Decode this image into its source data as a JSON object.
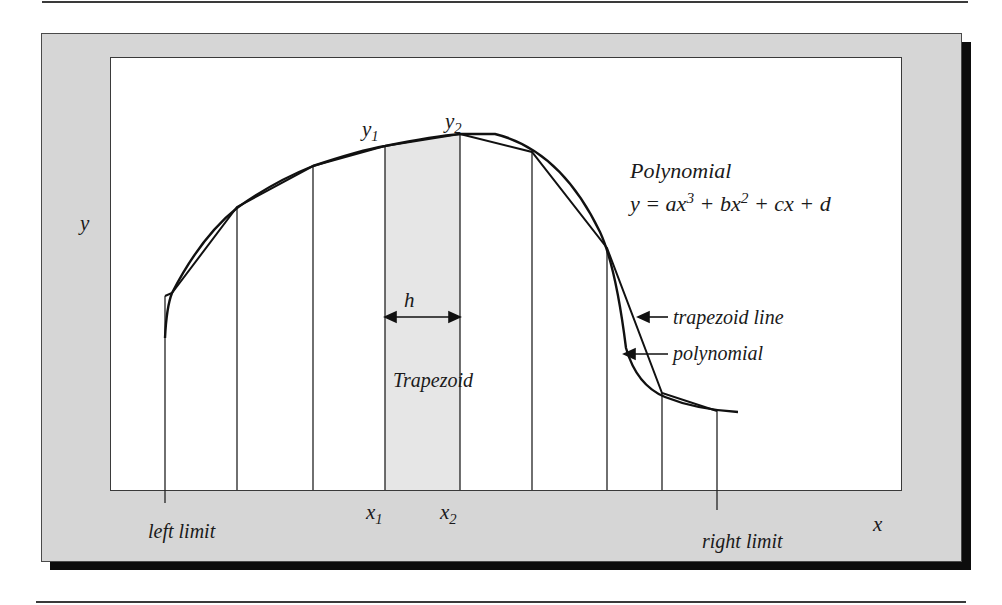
{
  "figure": {
    "axis_labels": {
      "x": "x",
      "y": "y"
    },
    "limits": {
      "left": "left limit",
      "right": "right limit"
    },
    "points": {
      "y1": {
        "base": "y",
        "sub": "1"
      },
      "y2": {
        "base": "y",
        "sub": "2"
      },
      "x1": {
        "base": "x",
        "sub": "1"
      },
      "x2": {
        "base": "x",
        "sub": "2"
      }
    },
    "width_label": "h",
    "trapezoid_label": "Trapezoid",
    "polynomial_title": "Polynomial",
    "equation": {
      "lhs": "y = ax",
      "exp1": "3",
      "mid1": " + bx",
      "exp2": "2",
      "rest": " + cx + d"
    },
    "callouts": {
      "trapezoid_line": "trapezoid line",
      "polynomial": "polynomial"
    },
    "colors": {
      "frame": "#d6d6d6",
      "shaded_trapezoid": "#e6e6e6",
      "shadow": "#0d0d0d",
      "line": "#111111"
    }
  }
}
